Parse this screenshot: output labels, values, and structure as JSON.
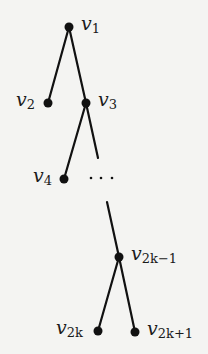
{
  "diagram": {
    "type": "binary tree (caterpillar)",
    "nodes": [
      {
        "id": "v1",
        "base": "v",
        "sub": "1",
        "x": 69,
        "y": 27,
        "label_side": "right"
      },
      {
        "id": "v2",
        "base": "v",
        "sub": "2",
        "x": 48,
        "y": 103,
        "label_side": "left"
      },
      {
        "id": "v3",
        "base": "v",
        "sub": "3",
        "x": 86,
        "y": 103,
        "label_side": "right"
      },
      {
        "id": "v4",
        "base": "v",
        "sub": "4",
        "x": 64,
        "y": 179,
        "label_side": "left"
      },
      {
        "id": "v2k-1",
        "base": "v",
        "sub": "2k−1",
        "x": 119,
        "y": 257,
        "label_side": "right"
      },
      {
        "id": "v2k",
        "base": "v",
        "sub": "2k",
        "x": 98,
        "y": 331,
        "label_side": "left"
      },
      {
        "id": "v2k+1",
        "base": "v",
        "sub": "2k+1",
        "x": 135,
        "y": 332,
        "label_side": "right"
      }
    ],
    "edges": [
      {
        "from": "v1",
        "to": "v2"
      },
      {
        "from": "v1",
        "to": "v3"
      },
      {
        "from": "v3",
        "to": "v4"
      },
      {
        "from": "v3",
        "to": "ellipsis-top",
        "partial": true
      },
      {
        "from": "ellipsis-bottom",
        "to": "v2k-1",
        "partial": true
      },
      {
        "from": "v2k-1",
        "to": "v2k"
      },
      {
        "from": "v2k-1",
        "to": "v2k+1"
      }
    ],
    "ellipsis": "· · ·",
    "colors": {
      "background": "#f4f4f2",
      "ink": "#111111"
    }
  },
  "labels": {
    "v1": {
      "base": "v",
      "sub": "1"
    },
    "v2": {
      "base": "v",
      "sub": "2"
    },
    "v3": {
      "base": "v",
      "sub": "3"
    },
    "v4": {
      "base": "v",
      "sub": "4"
    },
    "v2k_minus_1": {
      "base": "v",
      "sub": "2k−1"
    },
    "v2k": {
      "base": "v",
      "sub": "2k"
    },
    "v2k_plus_1": {
      "base": "v",
      "sub": "2k+1"
    },
    "ellipsis": "· · ·"
  }
}
